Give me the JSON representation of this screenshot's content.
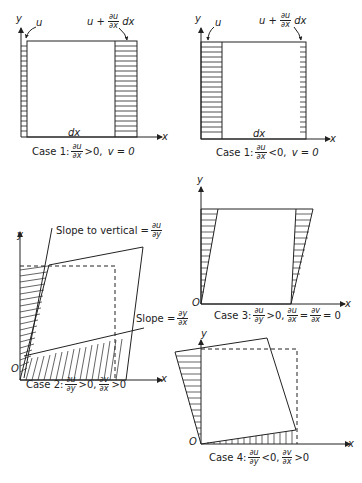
{
  "axes": {
    "x": "x",
    "y": "y",
    "origin": "O"
  },
  "labels": {
    "u": "u",
    "u_plus": "u +",
    "dx": "dx",
    "du": "∂u",
    "dxd": "∂x",
    "dy": "∂y",
    "dv": "∂v",
    "dyn": "∂y"
  },
  "panels": [
    {
      "id": "case1a",
      "caption_prefix": "Case 1:",
      "rel": ">0,",
      "extra": "v = 0"
    },
    {
      "id": "case1b",
      "caption_prefix": "Case 1:",
      "rel": "<0,",
      "extra": "v = 0"
    },
    {
      "id": "case2",
      "caption_prefix": "Case 2:",
      "rel1": ">0,",
      "rel2": ">0"
    },
    {
      "id": "case3",
      "caption_prefix": "Case 3:",
      "rel1": ">0,",
      "eq": "=",
      "tail": "= 0"
    },
    {
      "id": "case4",
      "caption_prefix": "Case 4:",
      "rel1": "<0,",
      "rel2": ">0"
    }
  ],
  "annotations": {
    "slope_vertical": "Slope to vertical =",
    "slope": "Slope ="
  }
}
